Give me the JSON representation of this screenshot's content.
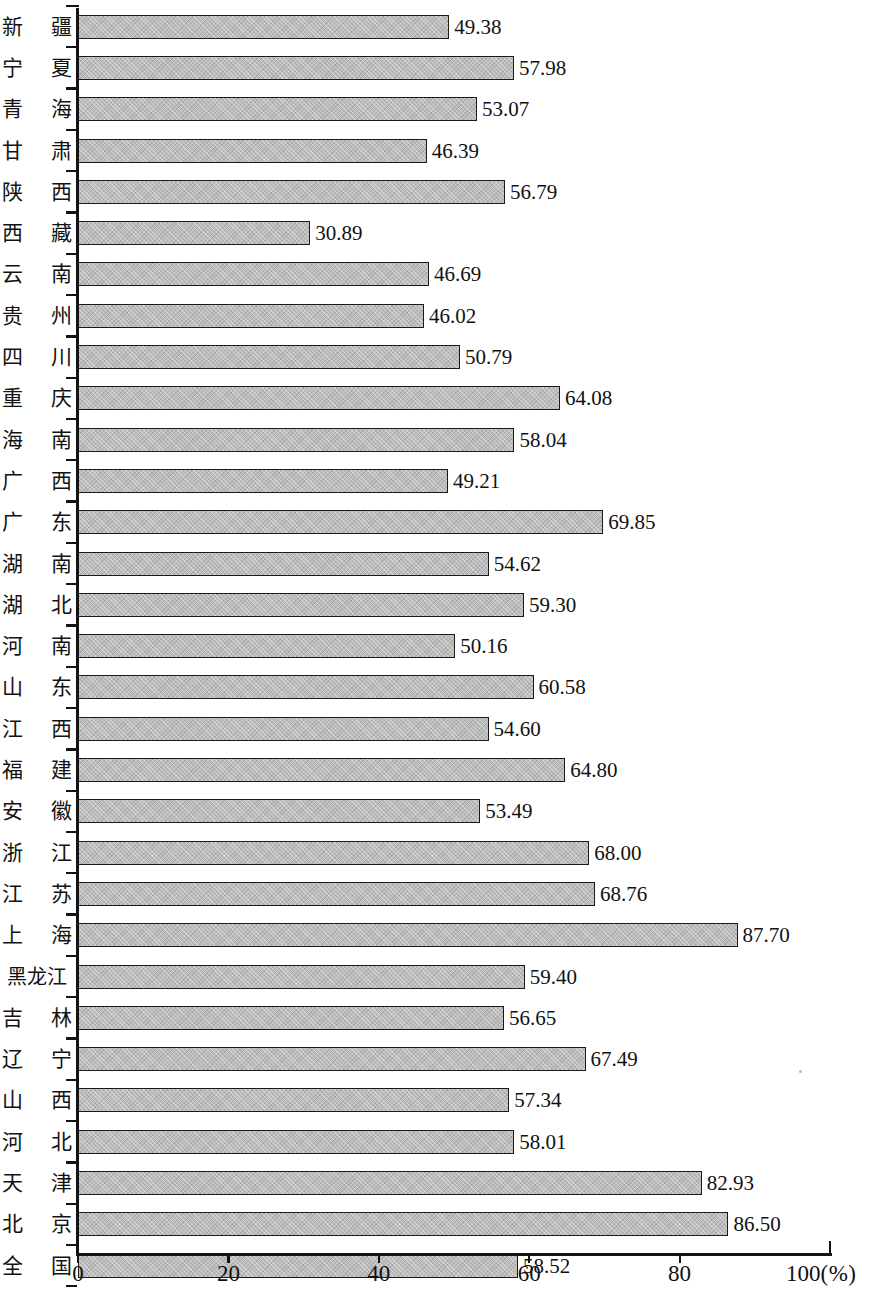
{
  "chart_data": {
    "type": "bar",
    "orientation": "horizontal",
    "title": "",
    "subtitle": "",
    "xlabel": "100(%)",
    "ylabel": "",
    "unit": "%",
    "xlim": [
      0,
      100
    ],
    "grid": false,
    "legend": null,
    "xticks": [
      "0",
      "20",
      "40",
      "60",
      "80",
      "100"
    ],
    "xtick_values": [
      0,
      20,
      40,
      60,
      80,
      100
    ],
    "categories": [
      "新 疆",
      "宁 夏",
      "青 海",
      "甘 肃",
      "陕 西",
      "西 藏",
      "云 南",
      "贵 州",
      "四 川",
      "重 庆",
      "海 南",
      "广 西",
      "广 东",
      "湖 南",
      "湖 北",
      "河 南",
      "山 东",
      "江 西",
      "福 建",
      "安 徽",
      "浙 江",
      "江 苏",
      "上 海",
      "黑龙江",
      "吉 林",
      "辽 宁",
      "山 西",
      "河 北",
      "天 津",
      "北 京",
      "全 国"
    ],
    "values": [
      49.38,
      57.98,
      53.07,
      46.39,
      56.79,
      30.89,
      46.69,
      46.02,
      50.79,
      64.08,
      58.04,
      49.21,
      69.85,
      54.62,
      59.3,
      50.16,
      60.58,
      54.6,
      64.8,
      53.49,
      68.0,
      68.76,
      87.7,
      59.4,
      56.65,
      67.49,
      57.34,
      58.01,
      82.93,
      86.5,
      58.52
    ],
    "value_labels": [
      "49.38",
      "57.98",
      "53.07",
      "46.39",
      "56.79",
      "30.89",
      "46.69",
      "46.02",
      "50.79",
      "64.08",
      "58.04",
      "49.21",
      "69.85",
      "54.62",
      "59.30",
      "50.16",
      "60.58",
      "54.60",
      "64.80",
      "53.49",
      "68.00",
      "68.76",
      "87.70",
      "59.40",
      "56.65",
      "67.49",
      "57.34",
      "58.01",
      "82.93",
      "86.50",
      "58.52"
    ],
    "bar_fill_color": "#bcbcbc",
    "bar_border_color": "#1a1a1a",
    "axis_color": "#141414"
  },
  "axis": {
    "x_unit_label": "100(%)",
    "x_unit_suffix": "(%)",
    "x_last_tick": "100"
  }
}
